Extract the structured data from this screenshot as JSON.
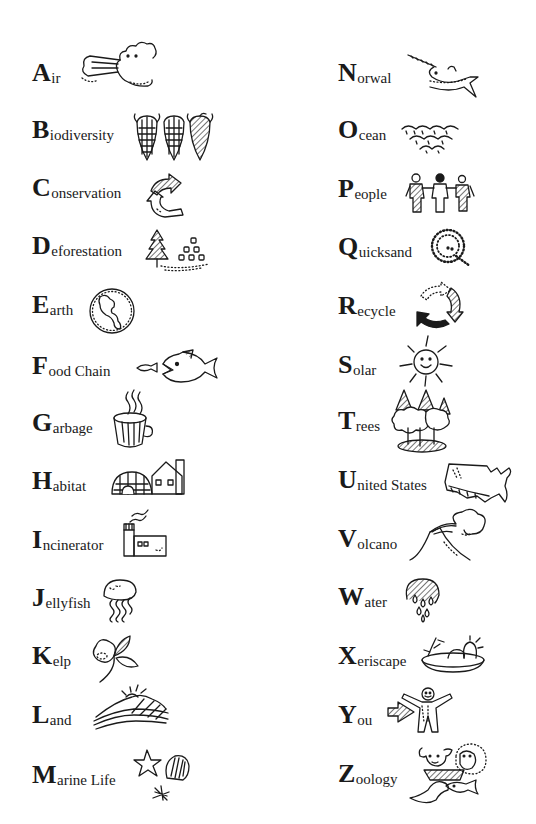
{
  "page": {
    "background": "#ffffff",
    "ink": "#1a1a1a"
  },
  "left_column": [
    {
      "letter": "A",
      "rest": "ir",
      "icon": "wind-cloud-icon"
    },
    {
      "letter": "B",
      "rest": "iodiversity",
      "icon": "corn-icon"
    },
    {
      "letter": "C",
      "rest": "onservation",
      "icon": "circular-arrows-icon"
    },
    {
      "letter": "D",
      "rest": "eforestation",
      "icon": "tree-stumps-icon"
    },
    {
      "letter": "E",
      "rest": "arth",
      "icon": "globe-icon"
    },
    {
      "letter": "F",
      "rest": "ood Chain",
      "icon": "fish-eating-fish-icon"
    },
    {
      "letter": "G",
      "rest": "arbage",
      "icon": "garbage-can-icon"
    },
    {
      "letter": "H",
      "rest": "abitat",
      "icon": "igloo-house-icon"
    },
    {
      "letter": "I",
      "rest": "ncinerator",
      "icon": "incinerator-icon"
    },
    {
      "letter": "J",
      "rest": "ellyfish",
      "icon": "jellyfish-icon"
    },
    {
      "letter": "K",
      "rest": "elp",
      "icon": "kelp-icon"
    },
    {
      "letter": "L",
      "rest": "and",
      "icon": "landscape-sun-icon"
    },
    {
      "letter": "M",
      "rest": "arine Life",
      "icon": "starfish-shell-icon"
    }
  ],
  "right_column": [
    {
      "letter": "N",
      "rest": "orwal",
      "icon": "narwhal-icon"
    },
    {
      "letter": "O",
      "rest": "cean",
      "icon": "waves-icon"
    },
    {
      "letter": "P",
      "rest": "eople",
      "icon": "people-holding-hands-icon"
    },
    {
      "letter": "Q",
      "rest": "uicksand",
      "icon": "quicksand-q-icon"
    },
    {
      "letter": "R",
      "rest": "ecycle",
      "icon": "recycle-arrows-icon"
    },
    {
      "letter": "S",
      "rest": "olar",
      "icon": "smiling-sun-icon"
    },
    {
      "letter": "T",
      "rest": "rees",
      "icon": "trees-icon"
    },
    {
      "letter": "U",
      "rest": "nited States",
      "icon": "usa-map-icon"
    },
    {
      "letter": "V",
      "rest": "olcano",
      "icon": "volcano-icon"
    },
    {
      "letter": "W",
      "rest": "ater",
      "icon": "water-drops-icon"
    },
    {
      "letter": "X",
      "rest": "eriscape",
      "icon": "xeriscape-bowl-icon"
    },
    {
      "letter": "Y",
      "rest": "ou",
      "icon": "person-arrow-icon"
    },
    {
      "letter": "Z",
      "rest": "oology",
      "icon": "animals-icon"
    }
  ]
}
